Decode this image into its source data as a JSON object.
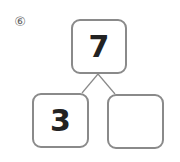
{
  "problem": {
    "number_label": "⑥"
  },
  "number_bond": {
    "whole": "7",
    "parts": [
      "3",
      ""
    ]
  },
  "colors": {
    "border": "#8a8a8a",
    "text": "#222222"
  }
}
